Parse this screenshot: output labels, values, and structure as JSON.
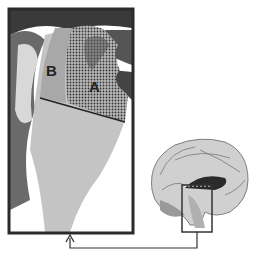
{
  "figure": {
    "type": "anatomical brain diagram",
    "zoom_panel": {
      "regions": [
        {
          "id": "A",
          "label": "A",
          "fill": "stippled"
        },
        {
          "id": "B",
          "label": "B",
          "fill": "gray"
        }
      ]
    },
    "inset": {
      "description": "medial (sagittal) view of brain with highlighted rectangle",
      "highlight_box": true
    },
    "connector": {
      "style": "arrow",
      "direction": "from inset box to zoom panel"
    }
  },
  "colors": {
    "frame": "#2a2a2a",
    "region_a": "#8a8a8a",
    "region_b": "#a6a6a6",
    "tissue": "#c8c8c8",
    "dark": "#3a3a3a"
  }
}
